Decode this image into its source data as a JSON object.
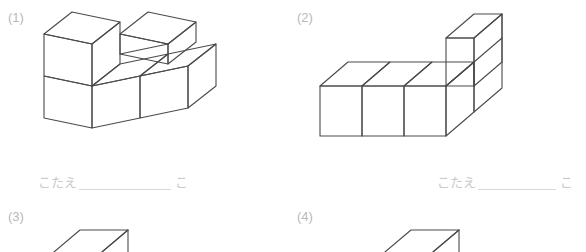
{
  "worksheet": {
    "title": "つみきの かず",
    "background_color": "#ffffff",
    "line_color": "#4a4a4a",
    "label_color": "#b9b9b9",
    "answer_text_color": "#c9c9c9"
  },
  "problems": [
    {
      "number": "(1)",
      "answer_label": "こたえ",
      "answer_value": "",
      "answer_unit": "こ",
      "shape": {
        "type": "isometric-cube-stack",
        "cube_count": 5,
        "description": "L-shaped stack: two cubes on the left bottom row with one cube stacked on the far-left, plus a raised cube behind and one cube to the right"
      }
    },
    {
      "number": "(2)",
      "answer_label": "こたえ",
      "answer_value": "",
      "answer_unit": "こ",
      "shape": {
        "type": "isometric-cube-stack",
        "cube_count": 5,
        "description": "Row of three cubes along the front with a tower of one cube rising at the right rear end"
      }
    },
    {
      "number": "(3)",
      "answer_label": "",
      "answer_value": "",
      "answer_unit": "",
      "shape": {
        "type": "isometric-cube-stack",
        "cube_count": 0,
        "description": "Top of figure only, cut off at page edge"
      }
    },
    {
      "number": "(4)",
      "answer_label": "",
      "answer_value": "",
      "answer_unit": "",
      "shape": {
        "type": "isometric-cube-stack",
        "cube_count": 0,
        "description": "Top of figure only, cut off at page edge"
      }
    }
  ]
}
